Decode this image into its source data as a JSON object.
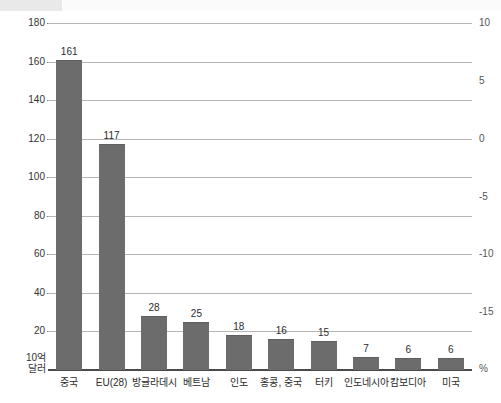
{
  "chart_data": {
    "type": "bar",
    "title": "",
    "subtitle": "",
    "xlabel": "",
    "ylabel": "10억 달러",
    "ylabel_right": "%",
    "categories": [
      "중국",
      "EU(28)",
      "방글라데시",
      "베트남",
      "인도",
      "홍콩, 중국",
      "터키",
      "인도네시아",
      "캄보디아",
      "미국"
    ],
    "values": [
      161,
      117,
      28,
      25,
      18,
      16,
      15,
      7,
      6,
      6
    ],
    "value_labels": [
      "161",
      "117",
      "28",
      "25",
      "18",
      "16",
      "15",
      "7",
      "6",
      "6"
    ],
    "ylim": [
      0,
      180
    ],
    "yticks": [
      0,
      20,
      40,
      60,
      80,
      100,
      120,
      140,
      160,
      180
    ],
    "ytick_labels": [
      "10억\n달러",
      "20",
      "40",
      "60",
      "80",
      "100",
      "120",
      "140",
      "160",
      "180"
    ],
    "ylim_right": [
      -17.5,
      10
    ],
    "yticks_right": [
      10,
      5,
      0,
      -5,
      -10,
      -15
    ],
    "ytick_labels_right": [
      "10",
      "5",
      "0",
      "-5",
      "-10",
      "-15"
    ],
    "grid": true,
    "legend": "none",
    "series": [
      {
        "name": "수출액",
        "values": [
          161,
          117,
          28,
          25,
          18,
          16,
          15,
          7,
          6,
          6
        ]
      }
    ]
  },
  "axis": {
    "left_bottom_label_line1": "10억",
    "left_bottom_label_line2": "달러",
    "right_bottom_label": "%"
  },
  "colors": {
    "bar": "#6c6c6c",
    "gridline": "#b5b5b5",
    "baseline": "#4a4a4a",
    "text": "#2b2b2b",
    "header_band": "#e9e9e9"
  }
}
